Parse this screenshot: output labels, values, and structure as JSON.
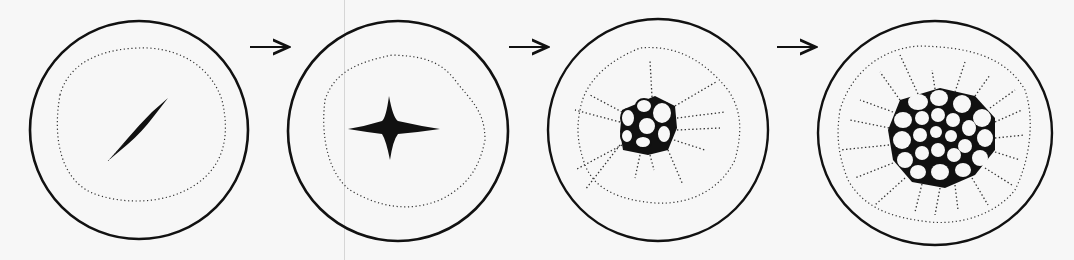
{
  "figure": {
    "type": "stage-sequence",
    "stages": [
      {
        "id": 1,
        "center": [
          139,
          130
        ],
        "radius": 109,
        "inner_radius": 80,
        "core": "spindle"
      },
      {
        "id": 2,
        "center": [
          398,
          131
        ],
        "radius": 110,
        "inner_radius": 82,
        "core": "four-point-star"
      },
      {
        "id": 3,
        "center": [
          658,
          130
        ],
        "radius": 110,
        "inner_radius": 86,
        "core": "small-cell-cluster"
      },
      {
        "id": 4,
        "center": [
          935,
          133
        ],
        "radius": 117,
        "inner_radius": 94,
        "core": "large-cell-network"
      }
    ],
    "arrows": [
      {
        "from_stage": 1,
        "to_stage": 2,
        "x1": 250,
        "x2": 288,
        "y": 47
      },
      {
        "from_stage": 2,
        "to_stage": 3,
        "x1": 509,
        "x2": 547,
        "y": 47
      },
      {
        "from_stage": 3,
        "to_stage": 4,
        "x1": 777,
        "x2": 815,
        "y": 47
      }
    ],
    "colors": {
      "ink": "#111111",
      "dots": "#333333",
      "paper": "#f7f7f7"
    }
  }
}
